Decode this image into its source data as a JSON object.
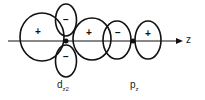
{
  "diagram": {
    "axis_label": "z",
    "orbitals": [
      {
        "name": "d",
        "subscript": "z2",
        "label_main": "d",
        "label_sub": "z",
        "label_sup": "2"
      },
      {
        "name": "p",
        "subscript": "z",
        "label_main": "p",
        "label_sub": "z"
      }
    ],
    "signs": {
      "d_left": "+",
      "d_top": "−",
      "d_bottom": "−",
      "d_right": "+",
      "p_left": "−",
      "p_right": "+"
    }
  }
}
